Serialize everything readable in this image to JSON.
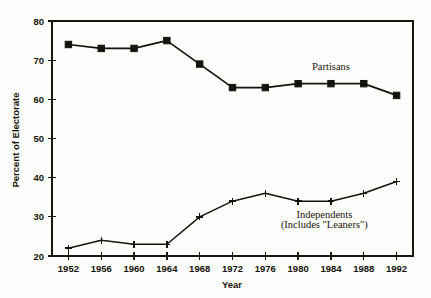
{
  "chart_data": {
    "type": "line",
    "title": "",
    "xlabel": "Year",
    "ylabel": "Percent of Electorate",
    "x": [
      1952,
      1956,
      1960,
      1964,
      1968,
      1972,
      1976,
      1980,
      1984,
      1988,
      1992
    ],
    "xticklabels": [
      "1952",
      "1956",
      "1960",
      "1964",
      "1968",
      "1972",
      "1976",
      "1980",
      "1984",
      "1988",
      "1992"
    ],
    "yticklabels": [
      "20",
      "30",
      "40",
      "50",
      "60",
      "70",
      "80"
    ],
    "yticks": [
      20,
      30,
      40,
      50,
      60,
      70,
      80
    ],
    "xlim": [
      1950,
      1994
    ],
    "ylim": [
      20,
      80
    ],
    "grid": false,
    "legend": "inline-annotations",
    "series": [
      {
        "name": "Partisans",
        "marker": "filled-square",
        "values": [
          74,
          73,
          73,
          75,
          69,
          63,
          63,
          64,
          64,
          64,
          61
        ]
      },
      {
        "name": "Independents",
        "marker": "plus",
        "values": [
          22,
          24,
          23,
          23,
          30,
          34,
          36,
          34,
          34,
          36,
          39
        ]
      }
    ],
    "annotations": [
      {
        "id": "partisans-label",
        "text": "Partisans",
        "x": 1984,
        "y": 67.5
      },
      {
        "id": "independents-label",
        "text": "Independents",
        "x": 1983.2,
        "y": 29.8
      },
      {
        "id": "independents-sublabel",
        "text": "(Includes \"Leaners\")",
        "x": 1983.2,
        "y": 27.2
      }
    ],
    "colors": {
      "ink": "#14130c",
      "background": "#fdfdfb"
    }
  }
}
